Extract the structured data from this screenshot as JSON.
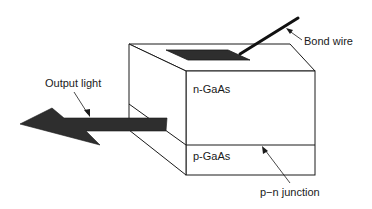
{
  "diagram": {
    "type": "LED structure schematic",
    "labels": {
      "bond_wire": "Bond wire",
      "output_light": "Output light",
      "n_layer": "n-GaAs",
      "p_layer": "p-GaAs",
      "junction": "p−n junction"
    },
    "colors": {
      "line": "#1a1a1a",
      "fill_dark": "#2e2e2e",
      "background": "#ffffff"
    }
  }
}
